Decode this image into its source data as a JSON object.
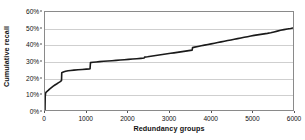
{
  "chart_data": {
    "type": "line",
    "title": "",
    "subtitle": "",
    "xlabel": "Redundancy groups",
    "ylabel": "Cumulative recall",
    "xlim": [
      0,
      6000
    ],
    "ylim": [
      0,
      60
    ],
    "grid": true,
    "legend": null,
    "legend_position": "none",
    "y_tick_suffix": "%",
    "x_ticks": [
      0,
      1000,
      2000,
      3000,
      4000,
      5000,
      6000
    ],
    "x_tick_labels": [
      "0",
      "1000",
      "2000",
      "3000",
      "4000",
      "5000",
      "6000"
    ],
    "y_ticks": [
      0,
      10,
      20,
      30,
      40,
      50,
      60
    ],
    "y_tick_labels": [
      "0%",
      "10%",
      "20%",
      "30%",
      "40%",
      "50%",
      "60%"
    ],
    "series": [
      {
        "name": "Cumulative recall",
        "color": "#1a1a1a",
        "line_width": 1.6,
        "x": [
          0,
          5,
          15,
          30,
          50,
          70,
          90,
          110,
          140,
          170,
          200,
          240,
          280,
          320,
          360,
          390,
          400,
          405,
          430,
          460,
          500,
          560,
          620,
          700,
          800,
          900,
          1000,
          1080,
          1090,
          1100,
          1160,
          1240,
          1320,
          1420,
          1520,
          1620,
          1720,
          1820,
          1920,
          2020,
          2120,
          2220,
          2320,
          2400,
          2410,
          2480,
          2560,
          2640,
          2720,
          2800,
          2880,
          2960,
          3040,
          3120,
          3200,
          3280,
          3360,
          3440,
          3520,
          3560,
          3570,
          3620,
          3700,
          3780,
          3860,
          3940,
          4020,
          4100,
          4180,
          4260,
          4340,
          4420,
          4500,
          4580,
          4660,
          4740,
          4820,
          4900,
          4980,
          5060,
          5140,
          5220,
          5300,
          5380,
          5460,
          5540,
          5620,
          5700,
          5780,
          5860,
          5940,
          6000
        ],
        "y": [
          0,
          8.2,
          10.4,
          11.0,
          11.4,
          11.8,
          12.3,
          12.8,
          13.4,
          14.0,
          14.6,
          15.3,
          15.9,
          16.6,
          17.2,
          17.8,
          18.0,
          22.8,
          23.1,
          23.4,
          23.7,
          24.0,
          24.2,
          24.4,
          24.6,
          24.8,
          25.0,
          25.2,
          25.3,
          29.0,
          29.2,
          29.4,
          29.6,
          29.8,
          30.0,
          30.2,
          30.4,
          30.6,
          30.8,
          31.0,
          31.2,
          31.4,
          31.6,
          31.8,
          32.4,
          32.6,
          32.9,
          33.2,
          33.5,
          33.8,
          34.1,
          34.4,
          34.7,
          35.0,
          35.3,
          35.6,
          35.9,
          36.2,
          36.5,
          36.6,
          38.2,
          38.5,
          38.9,
          39.3,
          39.7,
          40.1,
          40.5,
          40.9,
          41.3,
          41.7,
          42.1,
          42.5,
          42.9,
          43.3,
          43.7,
          44.1,
          44.5,
          44.9,
          45.3,
          45.7,
          46.0,
          46.3,
          46.6,
          46.9,
          47.3,
          47.8,
          48.3,
          48.8,
          49.2,
          49.6,
          49.9,
          50.2
        ]
      }
    ],
    "annotations": [
      {
        "text": "steep initial rise to ~11% near x=0"
      },
      {
        "text": "step jump from ~18% to ~23% at x≈400"
      },
      {
        "text": "step jump from ~25% to ~29% at x≈1090"
      },
      {
        "text": "step jump from ~36.6% to ~38.2% at x≈3560"
      }
    ]
  },
  "axes": {
    "y_title": "Cumulative recall",
    "x_title": "Redundancy groups"
  },
  "colors": {
    "series_line": "#1a1a1a",
    "gridline": "#cfcfcf",
    "axis_border": "#8a8a8a",
    "background": "#ffffff",
    "text": "#111111"
  }
}
